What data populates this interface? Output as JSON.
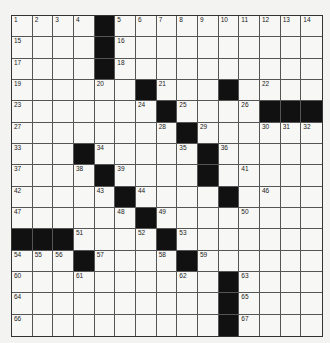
{
  "puzzle": {
    "rows": 15,
    "cols": 15,
    "colors": {
      "background": "#f3f3f1",
      "cell": "#f7f7f5",
      "black": "#111111",
      "line": "#555555"
    },
    "layout": [
      "....#..........",
      "....#..........",
      "....#..........",
      "......#...#....",
      ".......#....###",
      "........#......",
      "...#.....#.....",
      "....#....#.....",
      ".....#....#....",
      "......#........",
      "###....#.......",
      "...#....#......",
      "..........#....",
      "..........#....",
      "..........#...."
    ],
    "numbers": [
      [
        1,
        2,
        3,
        4,
        0,
        5,
        6,
        7,
        8,
        9,
        10,
        11,
        12,
        13,
        14
      ],
      [
        15,
        0,
        0,
        0,
        0,
        16,
        0,
        0,
        0,
        0,
        0,
        0,
        0,
        0,
        0
      ],
      [
        17,
        0,
        0,
        0,
        0,
        18,
        0,
        0,
        0,
        0,
        0,
        0,
        0,
        0,
        0
      ],
      [
        19,
        0,
        0,
        0,
        20,
        0,
        0,
        21,
        0,
        0,
        0,
        0,
        22,
        0,
        0
      ],
      [
        23,
        0,
        0,
        0,
        0,
        0,
        24,
        0,
        25,
        0,
        0,
        26,
        0,
        0,
        0
      ],
      [
        27,
        0,
        0,
        0,
        0,
        0,
        0,
        28,
        0,
        29,
        0,
        0,
        30,
        31,
        32
      ],
      [
        33,
        0,
        0,
        0,
        34,
        0,
        0,
        0,
        35,
        0,
        36,
        0,
        0,
        0,
        0
      ],
      [
        37,
        0,
        0,
        38,
        0,
        39,
        0,
        0,
        0,
        40,
        0,
        41,
        0,
        0,
        0
      ],
      [
        42,
        0,
        0,
        0,
        43,
        0,
        44,
        0,
        0,
        0,
        45,
        0,
        46,
        0,
        0
      ],
      [
        47,
        0,
        0,
        0,
        0,
        48,
        0,
        49,
        0,
        0,
        0,
        50,
        0,
        0,
        0
      ],
      [
        0,
        0,
        0,
        51,
        0,
        0,
        52,
        0,
        53,
        0,
        0,
        0,
        0,
        0,
        0
      ],
      [
        54,
        55,
        56,
        0,
        57,
        0,
        0,
        58,
        0,
        59,
        0,
        0,
        0,
        0,
        0
      ],
      [
        60,
        0,
        0,
        61,
        0,
        0,
        0,
        0,
        62,
        0,
        0,
        63,
        0,
        0,
        0
      ],
      [
        64,
        0,
        0,
        0,
        0,
        0,
        0,
        0,
        0,
        0,
        0,
        65,
        0,
        0,
        0
      ],
      [
        66,
        0,
        0,
        0,
        0,
        0,
        0,
        0,
        0,
        0,
        0,
        67,
        0,
        0,
        0
      ]
    ]
  }
}
